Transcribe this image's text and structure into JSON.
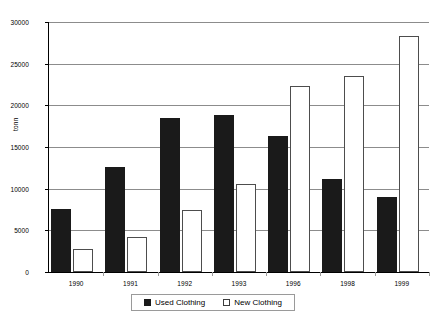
{
  "chart_data": {
    "type": "bar",
    "title": "",
    "subtitle": "",
    "xlabel": "",
    "ylabel": "tonn",
    "ylim": [
      0,
      30000
    ],
    "ytick_values": [
      0,
      5000,
      10000,
      15000,
      20000,
      25000,
      30000
    ],
    "ytick_labels": [
      "0",
      "5000",
      "10000",
      "15000",
      "20000",
      "25000",
      "30000"
    ],
    "grid": true,
    "legend_position": "bottom-center",
    "categories": [
      "1990",
      "1991",
      "1992",
      "1993",
      "1996",
      "1998",
      "1999"
    ],
    "series": [
      {
        "name": "Used Clothing",
        "color": "#1a1a1a",
        "fill": "solid",
        "values": [
          7600,
          12600,
          18500,
          18800,
          16300,
          11200,
          9000
        ]
      },
      {
        "name": "New Clothing",
        "color": "#ffffff",
        "fill": "hollow",
        "values": [
          2800,
          4200,
          7500,
          10600,
          22300,
          23500,
          28300
        ]
      }
    ]
  },
  "legend": {
    "entries": [
      {
        "label": "Used Clothing",
        "swatch": "filled-square-black"
      },
      {
        "label": "New Clothing",
        "swatch": "hollow-square-white"
      }
    ]
  }
}
